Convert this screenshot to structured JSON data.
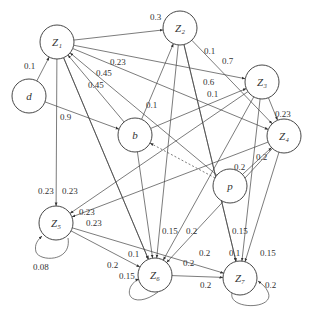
{
  "diagram": {
    "type": "weighted-directed-graph",
    "nodes": [
      {
        "id": "Z1",
        "label": "Z₁",
        "x": 57,
        "y": 42
      },
      {
        "id": "Z2",
        "label": "Z₂",
        "x": 180,
        "y": 28
      },
      {
        "id": "Z3",
        "label": "Z₃",
        "x": 262,
        "y": 82
      },
      {
        "id": "Z4",
        "label": "Z₄",
        "x": 284,
        "y": 136
      },
      {
        "id": "d",
        "label": "d",
        "x": 29,
        "y": 96
      },
      {
        "id": "b",
        "label": "b",
        "x": 135,
        "y": 135
      },
      {
        "id": "p",
        "label": "p",
        "x": 230,
        "y": 186
      },
      {
        "id": "Z5",
        "label": "Z₅",
        "x": 56,
        "y": 223
      },
      {
        "id": "Z6",
        "label": "Z₆",
        "x": 155,
        "y": 275
      },
      {
        "id": "Z7",
        "label": "Z₇",
        "x": 240,
        "y": 278
      }
    ],
    "edges": [
      {
        "from": "d",
        "to": "Z1",
        "label": "0.1",
        "lx": 24,
        "ly": 69
      },
      {
        "from": "Z1",
        "to": "Z2",
        "label": "0.3",
        "lx": 150,
        "ly": 20
      },
      {
        "from": "Z1",
        "to": "Z3",
        "label": "0.7",
        "lx": 222,
        "ly": 64
      },
      {
        "from": "Z1",
        "to": "Z4",
        "label": "0.23",
        "lx": 110,
        "ly": 65
      },
      {
        "from": "b",
        "to": "Z1",
        "label": "0.45",
        "lx": 96,
        "ly": 76
      },
      {
        "from": "p",
        "to": "Z1",
        "label": "0.45",
        "lx": 88,
        "ly": 88
      },
      {
        "from": "d",
        "to": "b",
        "label": "0.9",
        "lx": 60,
        "ly": 120
      },
      {
        "from": "Z1",
        "to": "Z5",
        "label": "0.23",
        "lx": 38,
        "ly": 194
      },
      {
        "from": "Z1",
        "to": "Z6",
        "label": "0.23",
        "lx": 62,
        "ly": 194
      },
      {
        "from": "Z2",
        "to": "Z4",
        "label": "0.1",
        "lx": 204,
        "ly": 54
      },
      {
        "from": "b",
        "to": "Z2",
        "label": "0.1",
        "lx": 146,
        "ly": 108
      },
      {
        "from": "Z2",
        "to": "Z7",
        "label": "0.6",
        "lx": 203,
        "ly": 85
      },
      {
        "from": "b",
        "to": "Z3",
        "label": "0.1",
        "lx": 207,
        "ly": 97
      },
      {
        "from": "Z3",
        "to": "Z4",
        "label": "0.23",
        "lx": 275,
        "ly": 117
      },
      {
        "from": "p",
        "to": "Z4",
        "label": "0.2",
        "lx": 256,
        "ly": 160
      },
      {
        "from": "Z3",
        "to": "Z5",
        "label": "0.23",
        "lx": 79,
        "ly": 215
      },
      {
        "from": "Z4",
        "to": "Z5",
        "label": "0.23",
        "lx": 86,
        "ly": 226
      },
      {
        "from": "Z3",
        "to": "Z6",
        "label": "0.2",
        "lx": 234,
        "ly": 170
      },
      {
        "from": "Z2",
        "to": "Z6",
        "label": "0.15",
        "lx": 162,
        "ly": 234
      },
      {
        "from": "b",
        "to": "Z6",
        "label": "0.2",
        "lx": 186,
        "ly": 234
      },
      {
        "from": "Z1",
        "to": "Z6b",
        "label": "0.1",
        "lx": 128,
        "ly": 257
      },
      {
        "from": "Z5",
        "to": "Z6",
        "label": "0.2",
        "lx": 107,
        "ly": 268
      },
      {
        "from": "Z4",
        "to": "Z6",
        "label": "0.2",
        "lx": 183,
        "ly": 266
      },
      {
        "from": "Z5",
        "to": "Z7",
        "label": "0.2",
        "lx": 199,
        "ly": 256
      },
      {
        "from": "Z2",
        "to": "Z7",
        "label": "0.1",
        "lx": 229,
        "ly": 256
      },
      {
        "from": "Z3",
        "to": "Z7",
        "label": "0.15",
        "lx": 232,
        "ly": 234
      },
      {
        "from": "Z4",
        "to": "Z7",
        "label": "0.15",
        "lx": 260,
        "ly": 256
      },
      {
        "from": "Z6",
        "to": "Z7",
        "label": "0.2",
        "lx": 200,
        "ly": 288
      },
      {
        "from": "Z5",
        "to": "Z5",
        "label": "0.08",
        "lx": 33,
        "ly": 270
      },
      {
        "from": "Z6",
        "to": "Z6",
        "label": "0.15",
        "lx": 119,
        "ly": 279
      },
      {
        "from": "Z7",
        "to": "Z7",
        "label": "0.2",
        "lx": 265,
        "ly": 288
      },
      {
        "from": "p",
        "to": "b",
        "label": "",
        "style": "dotted"
      }
    ]
  }
}
